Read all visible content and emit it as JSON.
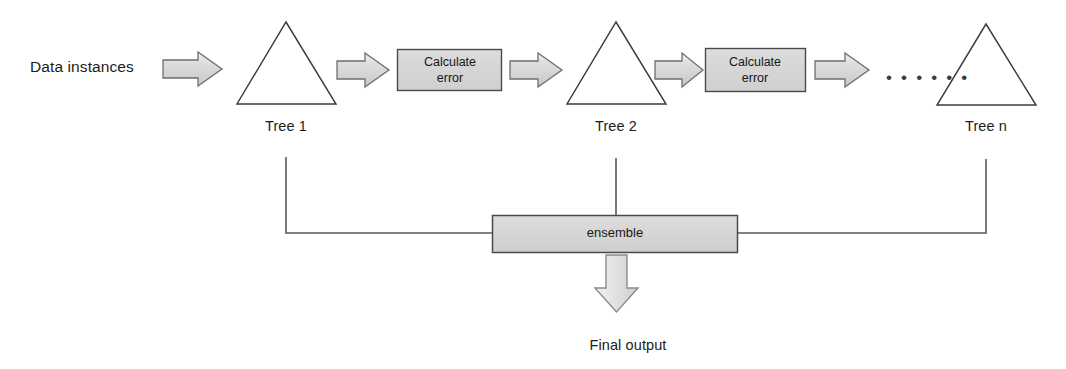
{
  "diagram": {
    "palette": {
      "background": "#ffffff",
      "arrow_fill": "#d4d4d4",
      "arrow_stroke": "#6e6e6e",
      "box_fill": "#d2d2d2",
      "box_stroke": "#4a4a4a",
      "triangle_stroke": "#3c3c3c",
      "line_stroke": "#5a5a5a",
      "text_color": "#1c1c1c"
    },
    "input_label": "Data instances",
    "trees": [
      {
        "id": "tree-1",
        "label": "Tree 1"
      },
      {
        "id": "tree-2",
        "label": "Tree 2"
      },
      {
        "id": "tree-n",
        "label": "Tree n"
      }
    ],
    "error_boxes": [
      {
        "id": "calculate-error-1",
        "line1": "Calculate",
        "line2": "error"
      },
      {
        "id": "calculate-error-2",
        "line1": "Calculate",
        "line2": "error"
      }
    ],
    "continuation_dots": "• • • • • •",
    "ensemble_label": "ensemble",
    "output_label": "Final output",
    "arrows": [
      {
        "id": "arrow-input-to-tree1",
        "direction": "right"
      },
      {
        "id": "arrow-tree1-to-error1",
        "direction": "right"
      },
      {
        "id": "arrow-error1-to-tree2",
        "direction": "right"
      },
      {
        "id": "arrow-tree2-to-error2",
        "direction": "right"
      },
      {
        "id": "arrow-error2-to-treen",
        "direction": "right"
      },
      {
        "id": "arrow-ensemble-to-output",
        "direction": "down"
      }
    ]
  }
}
